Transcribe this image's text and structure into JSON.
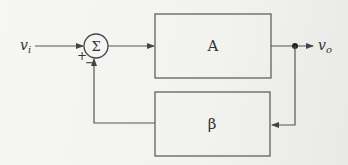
{
  "diagram": {
    "input_label": {
      "main": "v",
      "sub": "i"
    },
    "output_label": {
      "main": "v",
      "sub": "o"
    },
    "summing_junction": {
      "symbol": "Σ",
      "plus_sign": "+",
      "minus_sign": "−"
    },
    "blocks": [
      {
        "id": "forward",
        "label": "A"
      },
      {
        "id": "feedback",
        "label": "β"
      }
    ],
    "colors": {
      "line": "#555555",
      "text": "#333333"
    }
  }
}
